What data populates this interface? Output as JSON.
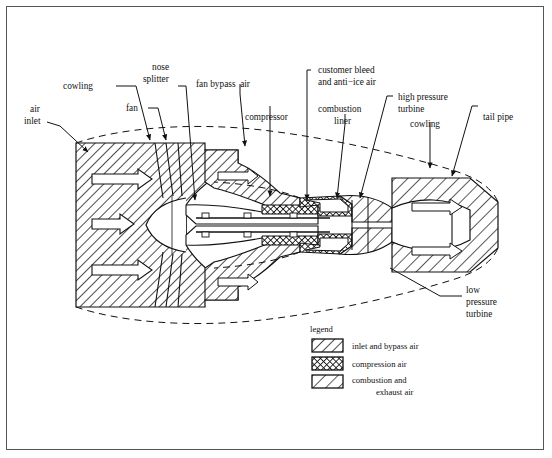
{
  "diagram": {
    "background": "#ffffff",
    "border_color": "#555555",
    "line_color": "#111111"
  },
  "labels": {
    "air_inlet_l1": "air",
    "air_inlet_l2": "inlet",
    "cowling_left": "cowling",
    "fan": "fan",
    "nose_splitter_l1": "nose",
    "nose_splitter_l2": "splitter",
    "fan_bypass_air": "fan bypass  air",
    "compressor": "compressor",
    "customer_bleed_l1": "customer bleed",
    "customer_bleed_l2": "and anti−ice air",
    "combustion_liner_l1": "combustion",
    "combustion_liner_l2": "liner",
    "high_pressure_turbine_l1": "high pressure",
    "high_pressure_turbine_l2": "turbine",
    "cowling_right": "cowling",
    "tail_pipe": "tail pipe",
    "low_pressure_turbine_l1": "low",
    "low_pressure_turbine_l2": "pressure",
    "low_pressure_turbine_l3": "turbine"
  },
  "legend": {
    "title": "legend",
    "items": [
      {
        "label": "inlet and bypass air",
        "label2": "",
        "pattern": "diagonal-hatch"
      },
      {
        "label": "compression air",
        "label2": "",
        "pattern": "cross-hatch"
      },
      {
        "label": "combustion and",
        "label2": "exhaust air",
        "pattern": "sparse-diagonal-hatch"
      }
    ]
  }
}
